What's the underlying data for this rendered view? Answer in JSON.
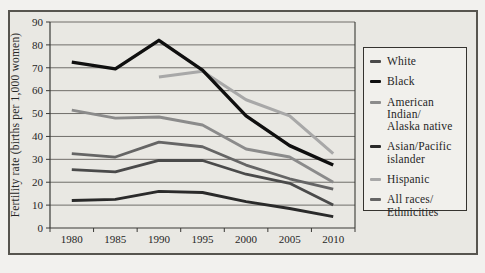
{
  "page": {
    "background": "#f2f1ee"
  },
  "figure": {
    "background": "#e9e8e3",
    "border_color": "#57554f",
    "text_color": "#262626",
    "grid_color": "#62605b",
    "axis_color": "#3a3936"
  },
  "legend": {
    "background": "#f1f0ec",
    "border_color": "#35332f",
    "position": "right"
  },
  "chart_data": {
    "type": "line",
    "title": "",
    "xlabel": "",
    "ylabel": "Fertility rate (births per 1,000 women)",
    "ylim": [
      0,
      90
    ],
    "ytick_step": 10,
    "yticks": [
      0,
      10,
      20,
      30,
      40,
      50,
      60,
      70,
      80,
      90
    ],
    "categories": [
      "1980",
      "1985",
      "1990",
      "1995",
      "2000",
      "2005",
      "2010"
    ],
    "grid": "horizontal",
    "legend_position": "right",
    "series": [
      {
        "name": "White",
        "label_lines": [
          "White"
        ],
        "color": "#4a4a4a",
        "stroke_width": 2.8,
        "z": 4,
        "values": [
          25.5,
          24.5,
          29.5,
          29.5,
          23.5,
          19.5,
          10
        ]
      },
      {
        "name": "Black",
        "label_lines": [
          "Black"
        ],
        "color": "#0f0f0f",
        "stroke_width": 3.4,
        "z": 6,
        "values": [
          72.5,
          69.5,
          82,
          69,
          49,
          36,
          27.5
        ]
      },
      {
        "name": "American Indian/Alaska native",
        "label_lines": [
          "American Indian/",
          "Alaska native"
        ],
        "color": "#8b8b8b",
        "stroke_width": 2.9,
        "z": 2,
        "values": [
          51.5,
          48,
          48.5,
          45,
          34.5,
          31,
          20
        ]
      },
      {
        "name": "Asian/Pacific islander",
        "label_lines": [
          "Asian/Pacific",
          "islander"
        ],
        "color": "#2a2a2a",
        "stroke_width": 2.9,
        "z": 5,
        "values": [
          12,
          12.5,
          16,
          15.5,
          11.5,
          8.5,
          5
        ]
      },
      {
        "name": "Hispanic",
        "label_lines": [
          "Hispanic"
        ],
        "color": "#a8a8a8",
        "stroke_width": 3.1,
        "z": 1,
        "values": [
          null,
          null,
          66,
          68.5,
          56,
          49,
          32.5
        ]
      },
      {
        "name": "All races/Ethnicities",
        "label_lines": [
          "All races/",
          "Ethnicities"
        ],
        "color": "#656565",
        "stroke_width": 2.8,
        "z": 3,
        "values": [
          32.5,
          31,
          37.5,
          35.5,
          27.5,
          21.5,
          17
        ]
      }
    ]
  }
}
